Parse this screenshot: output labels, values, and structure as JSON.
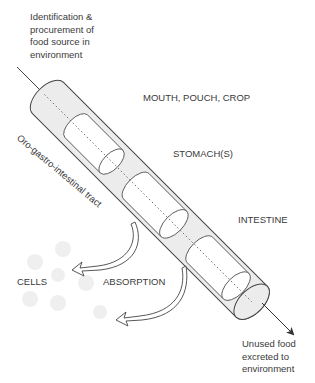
{
  "diagram": {
    "title_note": "Oro-gastro-intestinal tract",
    "input_label": "Identification &\nprocurement of\nfood source in\nenvironment",
    "output_label": "Unused food\nexcreted to\nenvironment",
    "segments": [
      {
        "id": "mouth",
        "label": "MOUTH, POUCH, CROP"
      },
      {
        "id": "stomach",
        "label": "STOMACH(S)"
      },
      {
        "id": "intestine",
        "label": "INTESTINE"
      }
    ],
    "absorption_label": "ABSORPTION",
    "cells_label": "CELLS",
    "colors": {
      "tube_fill": "#ececec",
      "segment_fill": "#ffffff",
      "line": "#444444",
      "cell_fill": "#ededed"
    }
  }
}
